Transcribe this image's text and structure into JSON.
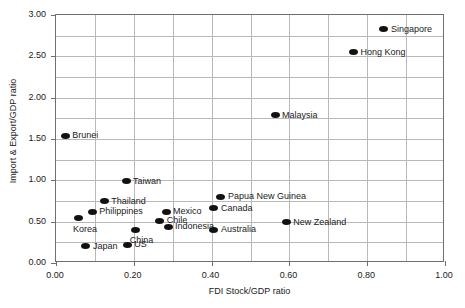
{
  "chart_data": {
    "type": "scatter",
    "title": "",
    "xlabel": "FDI Stock/GDP ratio",
    "ylabel": "Import & Export/GDP ratio",
    "xlim": [
      0.0,
      1.0
    ],
    "ylim": [
      0.0,
      3.0
    ],
    "x_ticks": [
      "0.00",
      "0.20",
      "0.40",
      "0.60",
      "0.80",
      "1.00"
    ],
    "x_tick_values": [
      0.0,
      0.2,
      0.4,
      0.6,
      0.8,
      1.0
    ],
    "x_gridline_values": [
      0.1,
      0.2,
      0.3,
      0.4,
      0.5,
      0.6,
      0.7,
      0.8,
      0.9
    ],
    "y_ticks": [
      "0.00",
      "0.50",
      "1.00",
      "1.50",
      "2.00",
      "2.50",
      "3.00"
    ],
    "y_tick_values": [
      0.0,
      0.5,
      1.0,
      1.5,
      2.0,
      2.5,
      3.0
    ],
    "y_gridline_values": [
      0.25,
      0.5,
      0.75,
      1.0,
      1.25,
      1.5,
      1.75,
      2.0,
      2.25,
      2.5,
      2.75
    ],
    "grid": true,
    "legend": "none",
    "marker_color": "#111111",
    "grid_color": "#b9b9b9",
    "frame_color": "#6f6f6f",
    "points": [
      {
        "label": "Singapore",
        "x": 0.843,
        "y": 2.83,
        "label_side": "right"
      },
      {
        "label": "Hong Kong",
        "x": 0.765,
        "y": 2.55,
        "label_side": "right"
      },
      {
        "label": "Malaysia",
        "x": 0.563,
        "y": 1.79,
        "label_side": "right"
      },
      {
        "label": "Brunei",
        "x": 0.024,
        "y": 1.54,
        "label_side": "right"
      },
      {
        "label": "Taiwan",
        "x": 0.18,
        "y": 0.99,
        "label_side": "right"
      },
      {
        "label": "Papua New Guinea",
        "x": 0.424,
        "y": 0.8,
        "label_side": "right"
      },
      {
        "label": "Thailand",
        "x": 0.124,
        "y": 0.75,
        "label_side": "right"
      },
      {
        "label": "Canada",
        "x": 0.406,
        "y": 0.66,
        "label_side": "right"
      },
      {
        "label": "Mexico",
        "x": 0.283,
        "y": 0.62,
        "label_side": "right"
      },
      {
        "label": "Philippines",
        "x": 0.093,
        "y": 0.62,
        "label_side": "right"
      },
      {
        "label": "Korea",
        "x": 0.059,
        "y": 0.54,
        "label_side": "below"
      },
      {
        "label": "Chile",
        "x": 0.267,
        "y": 0.51,
        "label_side": "right"
      },
      {
        "label": "New Zealand",
        "x": 0.592,
        "y": 0.49,
        "label_side": "right"
      },
      {
        "label": "Indonesia",
        "x": 0.288,
        "y": 0.44,
        "label_side": "right"
      },
      {
        "label": "Australia",
        "x": 0.406,
        "y": 0.4,
        "label_side": "right"
      },
      {
        "label": "China",
        "x": 0.205,
        "y": 0.4,
        "label_side": "below"
      },
      {
        "label": "US",
        "x": 0.183,
        "y": 0.22,
        "label_side": "right"
      },
      {
        "label": "Japan",
        "x": 0.077,
        "y": 0.2,
        "label_side": "right"
      }
    ]
  }
}
